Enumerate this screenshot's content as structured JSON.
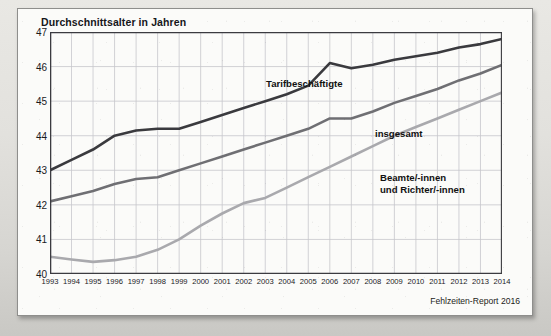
{
  "figure": {
    "title": "Durchschnittsalter in Jahren",
    "source_note": "Fehlzeiten-Report 2016"
  },
  "colors": {
    "series_tarifbeschaeftigte": "#3a3a3e",
    "series_insgesamt": "#6f6f73",
    "series_beamte": "#a9a9ad",
    "grid": "#c6c6cc",
    "axis": "#3b3b40",
    "panel_background": "#fbfbf9"
  },
  "chart_data": {
    "type": "line",
    "title": "Durchschnittsalter in Jahren",
    "xlabel": "",
    "ylabel": "Durchschnittsalter in Jahren",
    "ylim": [
      40,
      47
    ],
    "yticks": [
      40,
      41,
      42,
      43,
      44,
      45,
      46,
      47
    ],
    "grid": true,
    "legend": "inline-annotations",
    "categories": [
      "1993",
      "1994",
      "1995",
      "1996",
      "1997",
      "1998",
      "1999",
      "2000",
      "2001",
      "2002",
      "2003",
      "2004",
      "2005",
      "2006",
      "2007",
      "2008",
      "2009",
      "2010",
      "2011",
      "2012",
      "2013",
      "2014"
    ],
    "series": [
      {
        "name": "Tarifbeschäftigte",
        "color": "#3a3a3e",
        "values": [
          43.0,
          43.3,
          43.6,
          44.0,
          44.15,
          44.2,
          44.2,
          44.4,
          44.6,
          44.8,
          45.0,
          45.2,
          45.45,
          46.1,
          45.95,
          46.05,
          46.2,
          46.3,
          46.4,
          46.55,
          46.65,
          46.8
        ]
      },
      {
        "name": "insgesamt",
        "color": "#6f6f73",
        "values": [
          42.1,
          42.25,
          42.4,
          42.6,
          42.75,
          42.8,
          43.0,
          43.2,
          43.4,
          43.6,
          43.8,
          44.0,
          44.2,
          44.5,
          44.5,
          44.7,
          44.95,
          45.15,
          45.35,
          45.6,
          45.8,
          46.05
        ]
      },
      {
        "name": "Beamte/-innen und Richter/-innen",
        "color": "#a9a9ad",
        "values": [
          40.5,
          40.42,
          40.35,
          40.4,
          40.5,
          40.7,
          41.0,
          41.4,
          41.75,
          42.05,
          42.2,
          42.5,
          42.8,
          43.1,
          43.4,
          43.7,
          44.0,
          44.25,
          44.5,
          44.75,
          45.0,
          45.25
        ]
      }
    ],
    "annotations": [
      {
        "text": "Tarifbeschäftigte",
        "series": "Tarifbeschäftigte"
      },
      {
        "text": "insgesamt",
        "series": "insgesamt"
      },
      {
        "text": "Beamte/-innen",
        "series": "Beamte/-innen und Richter/-innen"
      },
      {
        "text": "und Richter/-innen",
        "series": "Beamte/-innen und Richter/-innen"
      }
    ]
  },
  "labels": {
    "tarif": "Tarifbeschäftigte",
    "insgesamt": "insgesamt",
    "beamte_line1": "Beamte/-innen",
    "beamte_line2": "und Richter/-innen"
  }
}
